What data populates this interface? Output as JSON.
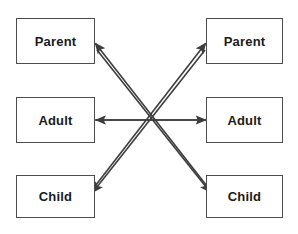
{
  "diagram": {
    "line_color": "#3d3d3d",
    "box_border_color": "#4d4d4d",
    "text_color": "#1a1a1a",
    "background_color": "#ffffff",
    "left_column": {
      "label": "Left person ego states",
      "boxes": [
        {
          "id": "left-parent",
          "label": "Parent"
        },
        {
          "id": "left-adult",
          "label": "Adult"
        },
        {
          "id": "left-child",
          "label": "Child"
        }
      ]
    },
    "right_column": {
      "label": "Right person ego states",
      "boxes": [
        {
          "id": "right-parent",
          "label": "Parent"
        },
        {
          "id": "right-adult",
          "label": "Adult"
        },
        {
          "id": "right-child",
          "label": "Child"
        }
      ]
    },
    "arrows": [
      {
        "id": "right-child-to-left-parent",
        "from": "right-child",
        "to": "left-parent",
        "direction": "upper-left"
      },
      {
        "id": "left-child-to-right-parent",
        "from": "left-child",
        "to": "right-parent",
        "direction": "upper-right"
      },
      {
        "id": "right-adult-to-left-adult",
        "from": "right-adult",
        "to": "left-adult",
        "direction": "left"
      },
      {
        "id": "left-adult-to-right-adult",
        "from": "left-adult",
        "to": "right-adult",
        "direction": "right"
      },
      {
        "id": "right-parent-to-left-child",
        "from": "right-parent",
        "to": "left-child",
        "direction": "lower-left"
      },
      {
        "id": "left-parent-to-right-child",
        "from": "left-parent",
        "to": "right-child",
        "direction": "lower-right"
      }
    ],
    "crossing_point": {
      "x": 151,
      "y": 120
    }
  }
}
